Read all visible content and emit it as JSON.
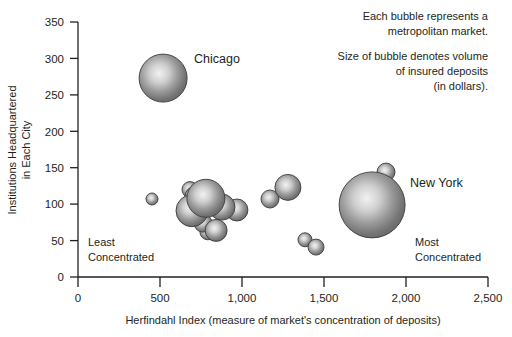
{
  "chart_data": {
    "type": "scatter",
    "title": "",
    "xlabel": "Herfindahl Index (measure of market's concentration of deposits)",
    "ylabel": "Institutions Headquartered in Each City",
    "ylabel_line1": "Institutions Headquartered",
    "ylabel_line2": "in Each City",
    "xlim": [
      0,
      2500
    ],
    "ylim": [
      0,
      350
    ],
    "xticks": [
      "0",
      "500",
      "1,000",
      "1,500",
      "2,000",
      "2,500"
    ],
    "xtick_values": [
      0,
      500,
      1000,
      1500,
      2000,
      2500
    ],
    "yticks": [
      "0",
      "50",
      "100",
      "150",
      "200",
      "250",
      "300",
      "350"
    ],
    "ytick_values": [
      0,
      50,
      100,
      150,
      200,
      250,
      300,
      350
    ],
    "grid": false,
    "legend": "none",
    "bubble_color": "#808080",
    "bubble_highlight": "#e8e8e8",
    "bubble_edge": "#3a3a3a",
    "series": [
      {
        "name": "Metropolitan markets",
        "size_meaning": "volume of insured deposits (in dollars)",
        "points": [
          {
            "label": "Chicago",
            "x": 519,
            "y": 273,
            "r_px": 24
          },
          {
            "label": "",
            "x": 451,
            "y": 107,
            "r_px": 6
          },
          {
            "label": "",
            "x": 683,
            "y": 120,
            "r_px": 8
          },
          {
            "label": "",
            "x": 719,
            "y": 110,
            "r_px": 11
          },
          {
            "label": "",
            "x": 695,
            "y": 91,
            "r_px": 16
          },
          {
            "label": "",
            "x": 780,
            "y": 108,
            "r_px": 19
          },
          {
            "label": "",
            "x": 762,
            "y": 74,
            "r_px": 9
          },
          {
            "label": "",
            "x": 792,
            "y": 62,
            "r_px": 8
          },
          {
            "label": "",
            "x": 842,
            "y": 64,
            "r_px": 11
          },
          {
            "label": "",
            "x": 878,
            "y": 96,
            "r_px": 13
          },
          {
            "label": "",
            "x": 969,
            "y": 92,
            "r_px": 11
          },
          {
            "label": "",
            "x": 1171,
            "y": 107,
            "r_px": 9
          },
          {
            "label": "",
            "x": 1280,
            "y": 123,
            "r_px": 13
          },
          {
            "label": "",
            "x": 1384,
            "y": 51,
            "r_px": 7
          },
          {
            "label": "",
            "x": 1451,
            "y": 41,
            "r_px": 8
          },
          {
            "label": "New York",
            "x": 1793,
            "y": 99,
            "r_px": 33
          },
          {
            "label": "",
            "x": 1878,
            "y": 144,
            "r_px": 9
          }
        ]
      }
    ],
    "annotations": [
      {
        "name": "note-bubble-meaning",
        "lines": [
          "Each bubble represents a",
          "metropolitan market."
        ]
      },
      {
        "name": "note-bubble-size",
        "lines": [
          "Size of bubble denotes volume",
          "of insured deposits",
          "(in dollars)."
        ]
      }
    ],
    "corner_labels": {
      "left": {
        "line1": "Least",
        "line2": "Concentrated"
      },
      "right": {
        "line1": "Most",
        "line2": "Concentrated"
      }
    },
    "point_labels": {
      "chicago": "Chicago",
      "new_york": "New York"
    }
  }
}
